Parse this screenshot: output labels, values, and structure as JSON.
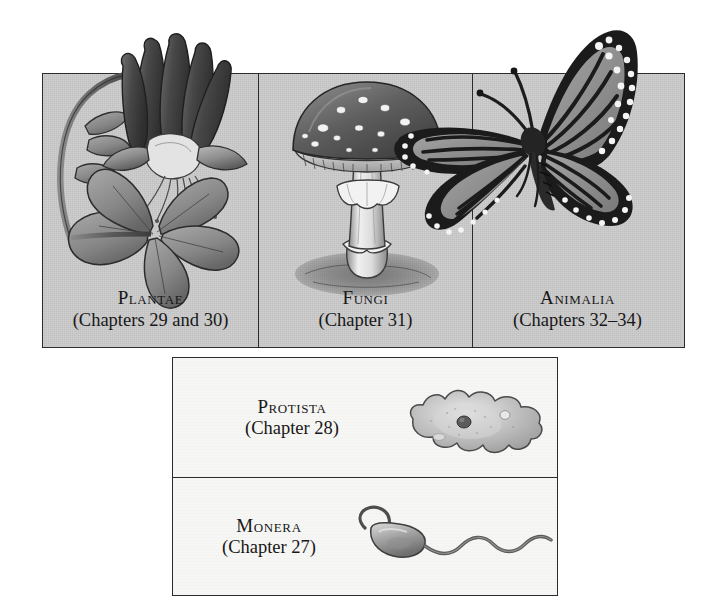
{
  "palette": {
    "top_panel_background": "#c9c9c9",
    "lower_panel_background": "#f6f6f4",
    "border": "#2b2b2b",
    "text": "#171717",
    "page_background": "#ffffff",
    "art_midtone": "#9a9a9a",
    "art_dark": "#3a3a3a"
  },
  "top_row": {
    "cells": [
      {
        "kingdom": "Plantae",
        "chapters": "(Chapters 29 and 30)",
        "organism": "columbine-flower",
        "organism_label": "flowering plant (columbine)"
      },
      {
        "kingdom": "Fungi",
        "chapters": "(Chapter 31)",
        "organism": "mushroom",
        "organism_label": "mushroom (Amanita)"
      },
      {
        "kingdom": "Animalia",
        "chapters": "(Chapters 32–34)",
        "organism": "monarch-butterfly",
        "organism_label": "monarch butterfly"
      }
    ]
  },
  "lower_stack": {
    "cells": [
      {
        "kingdom": "Protista",
        "chapters": "(Chapter 28)",
        "organism": "amoeba",
        "organism_label": "amoeba"
      },
      {
        "kingdom": "Monera",
        "chapters": "(Chapter 27)",
        "organism": "flagellated-bacterium",
        "organism_label": "flagellated bacterium"
      }
    ]
  }
}
